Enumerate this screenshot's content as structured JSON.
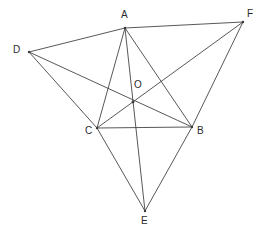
{
  "figure": {
    "kind": "geometry-diagram",
    "background_color": "#ffffff",
    "line_color": "#454545",
    "label_color": "#2c2c2c",
    "canvas": {
      "width": 265,
      "height": 237
    },
    "points": [
      {
        "id": "A",
        "label": "A",
        "x": 125,
        "y": 28,
        "label_x": 121,
        "label_y": 10
      },
      {
        "id": "B",
        "label": "B",
        "x": 192,
        "y": 127,
        "label_x": 197,
        "label_y": 126
      },
      {
        "id": "C",
        "label": "C",
        "x": 97,
        "y": 128,
        "label_x": 85,
        "label_y": 126
      },
      {
        "id": "D",
        "label": "D",
        "x": 29,
        "y": 52,
        "label_x": 13,
        "label_y": 45
      },
      {
        "id": "E",
        "label": "E",
        "x": 145,
        "y": 211,
        "label_x": 141,
        "label_y": 216
      },
      {
        "id": "F",
        "label": "F",
        "x": 243,
        "y": 22,
        "label_x": 247,
        "label_y": 9
      },
      {
        "id": "O",
        "label": "O",
        "x": 133,
        "y": 102,
        "label_x": 134,
        "label_y": 80
      }
    ],
    "segments": [
      {
        "name": "A-F",
        "from": "A",
        "to": "F"
      },
      {
        "name": "D-A",
        "from": "D",
        "to": "A"
      },
      {
        "name": "D-C",
        "from": "D",
        "to": "C"
      },
      {
        "name": "D-B",
        "from": "D",
        "to": "B"
      },
      {
        "name": "A-C",
        "from": "A",
        "to": "C"
      },
      {
        "name": "A-B",
        "from": "A",
        "to": "B"
      },
      {
        "name": "A-E",
        "from": "A",
        "to": "E"
      },
      {
        "name": "C-B",
        "from": "C",
        "to": "B"
      },
      {
        "name": "C-F",
        "from": "C",
        "to": "F"
      },
      {
        "name": "C-E",
        "from": "C",
        "to": "E"
      },
      {
        "name": "B-F",
        "from": "B",
        "to": "F"
      },
      {
        "name": "B-E",
        "from": "B",
        "to": "E"
      }
    ]
  }
}
